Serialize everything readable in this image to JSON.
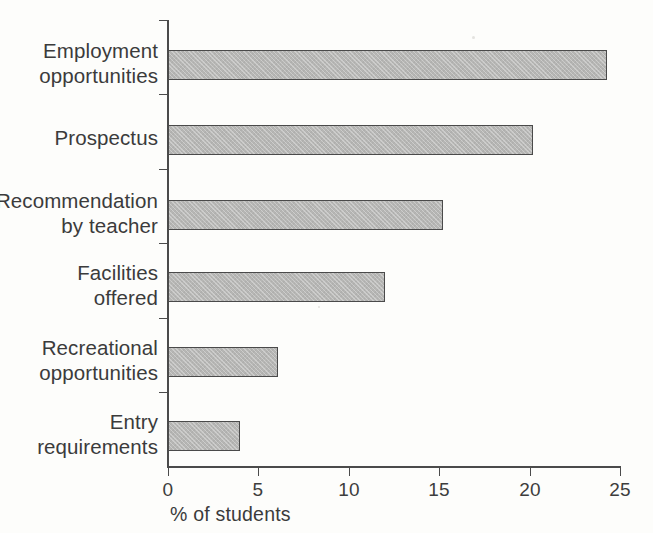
{
  "chart_data": {
    "type": "bar",
    "orientation": "horizontal",
    "title": "",
    "xlabel": "% of students",
    "ylabel": "",
    "categories": [
      "Employment opportunities",
      "Prospectus",
      "Recommendation by teacher",
      "Facilities offered",
      "Recreational opportunities",
      "Entry requirements"
    ],
    "category_lines": [
      [
        "Employment",
        "opportunities"
      ],
      [
        "Prospectus",
        ""
      ],
      [
        "Recommendation",
        "by teacher"
      ],
      [
        "Facilities",
        "offered"
      ],
      [
        "Recreational",
        "opportunities"
      ],
      [
        "Entry",
        "requirements"
      ]
    ],
    "values": [
      24.3,
      20.2,
      15.2,
      12.0,
      6.1,
      4.0
    ],
    "xlim": [
      0,
      25
    ],
    "xticks": [
      0,
      5,
      10,
      15,
      20,
      25
    ],
    "xtick_labels": [
      "0",
      "5",
      "10",
      "15",
      "20",
      "25"
    ],
    "grid": false,
    "legend": false,
    "bar_fill_color": "#b6b6b4",
    "bar_edge_color": "#4a4a4a",
    "axis_color": "#4b4b4b",
    "text_color": "#3b3b3b",
    "background_color": "#fdfdfb"
  }
}
